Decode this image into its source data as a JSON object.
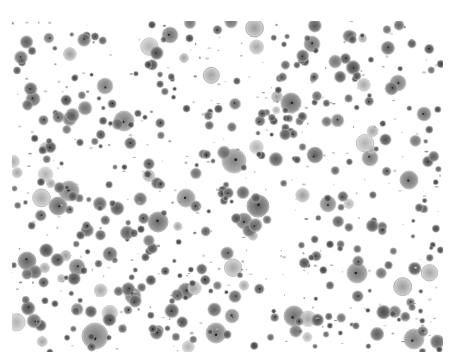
{
  "image": {
    "description": "Grayscale light micrograph of a dense field of round cells (cytology smear)",
    "colormap": "grayscale",
    "background_color": "#ffffff",
    "cell_color_dark": "#3a3a3a",
    "cell_color_mid": "#7a7a7a",
    "cell_color_light": "#bdbdbd"
  }
}
